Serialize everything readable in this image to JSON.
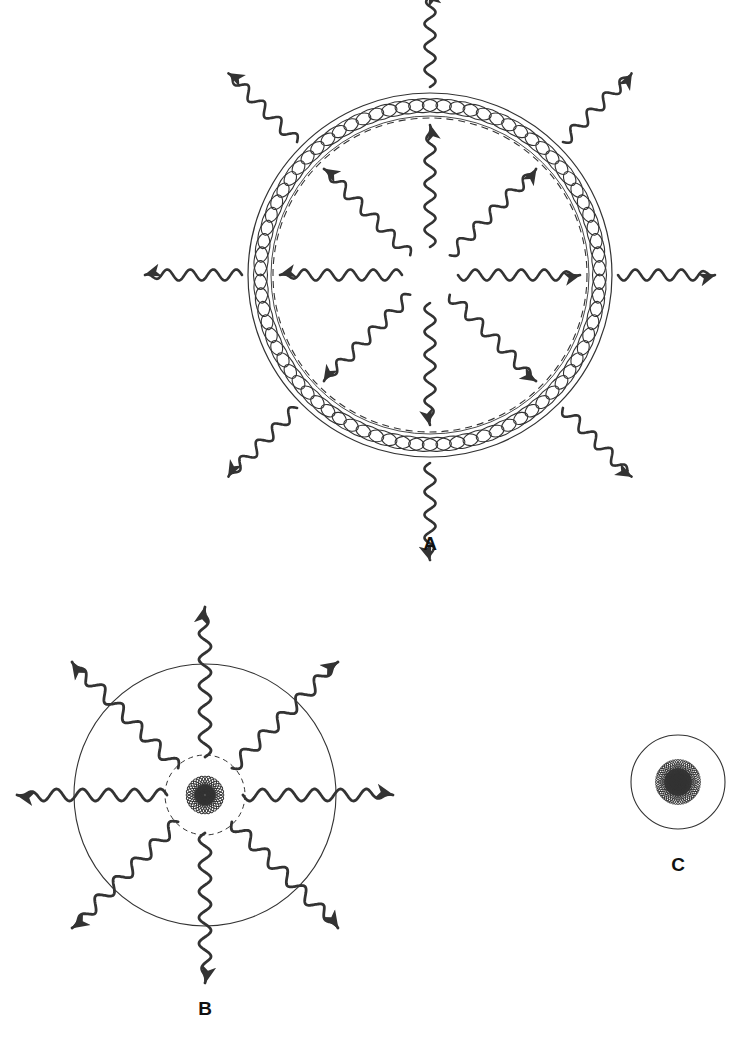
{
  "figure": {
    "canvas": {
      "width": 753,
      "height": 1047,
      "background": "#ffffff"
    },
    "stroke_color": "#333333",
    "label_color": "#111111"
  },
  "panels": [
    {
      "id": "A",
      "label": "A",
      "label_x": 430,
      "label_y": 545,
      "kind": "coiled-ring-resonator",
      "center_x": 430,
      "center_y": 275,
      "outer_radius": 182,
      "inner_dashed_radius": 157,
      "coil": {
        "turns": 78,
        "ellipse_rx": 14.5,
        "ellipse_ry": 7.0,
        "stroke_width": 1.1,
        "description": "overlapping tilted ellipses forming a spring ring"
      },
      "outer_circle_stroke_width": 1.2,
      "dashed_stroke_width": 1.1,
      "dash_pattern": "7,5",
      "rays": {
        "count": 8,
        "angles_deg": [
          270,
          315,
          0,
          45,
          90,
          135,
          180,
          225
        ],
        "inner": {
          "start_radius": 28,
          "end_radius": 150,
          "direction": "outward",
          "amplitude": 5.5,
          "wavelength": 23,
          "stroke_width": 2.6,
          "arrowhead": "at-outer-end"
        },
        "outer": {
          "start_radius": 188,
          "end_radius": 285,
          "direction": "outward",
          "amplitude": 5.5,
          "wavelength": 23,
          "stroke_width": 2.6,
          "arrowhead": "at-outer-end"
        }
      }
    },
    {
      "id": "B",
      "label": "B",
      "label_x": 205,
      "label_y": 1010,
      "kind": "rosette-core-with-ring",
      "center_x": 205,
      "center_y": 795,
      "ring_radius": 131,
      "ring_stroke_width": 1.1,
      "rosette": {
        "dashed_radius": 40,
        "dash_pattern": "5,4",
        "petals": 16,
        "ellipse_rx": 38,
        "ellipse_ry": 11,
        "inner_rings": 3,
        "inner_scale": [
          1.0,
          0.52,
          0.26
        ],
        "stroke_width": 1.0
      },
      "rays": {
        "count": 8,
        "angles_deg": [
          270,
          315,
          0,
          45,
          90,
          135,
          180,
          225
        ],
        "start_radius": 38,
        "end_radius": 188,
        "direction": "outward",
        "amplitude": 6.0,
        "wavelength": 26,
        "stroke_width": 2.8,
        "arrowhead": "at-outer-end"
      }
    },
    {
      "id": "C",
      "label": "C",
      "label_x": 678,
      "label_y": 866,
      "kind": "dense-rosette",
      "center_x": 678,
      "center_y": 782,
      "outline_radius": 47,
      "outline_stroke_width": 1.1,
      "rosette": {
        "petals": 26,
        "ellipse_rx": 45,
        "ellipse_ry": 11,
        "inner_rings": 4,
        "inner_scale": [
          1.0,
          0.6,
          0.34,
          0.17
        ],
        "stroke_width": 0.9
      },
      "rays": {
        "count": 0
      }
    }
  ],
  "legend_text": {
    "panel_a": "A",
    "panel_b": "B",
    "panel_c": "C"
  }
}
